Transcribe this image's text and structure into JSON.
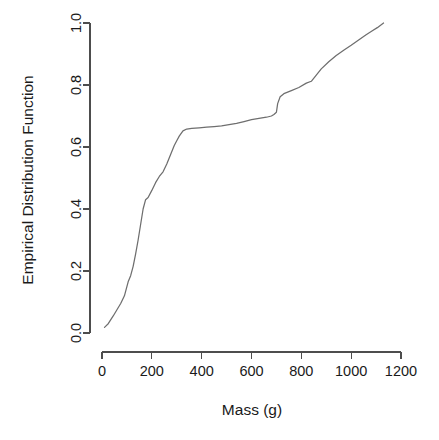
{
  "chart_data": {
    "type": "line",
    "title": "",
    "subtitle": "",
    "xlabel": "Mass (g)",
    "ylabel": "Empirical Distribution Function",
    "xlim": [
      0,
      1200
    ],
    "ylim": [
      0.0,
      1.0
    ],
    "xticks": [
      0,
      200,
      400,
      600,
      800,
      1000,
      1200
    ],
    "xtick_labels": [
      "0",
      "200",
      "400",
      "600",
      "800",
      "1000",
      "1200"
    ],
    "yticks": [
      0.0,
      0.2,
      0.4,
      0.6,
      0.8,
      1.0
    ],
    "ytick_labels": [
      "0.0",
      "0.2",
      "0.4",
      "0.6",
      "0.8",
      "1.0"
    ],
    "grid": false,
    "legend": null,
    "legend_position": "none",
    "line_color": "#6e6e6e",
    "axis_color": "#4d4d4d",
    "background_color": "#ffffff",
    "series": [
      {
        "name": "Empirical Distribution Function of Mass",
        "x": [
          10,
          25,
          45,
          60,
          75,
          90,
          105,
          115,
          125,
          135,
          145,
          155,
          165,
          175,
          185,
          200,
          215,
          230,
          245,
          260,
          275,
          290,
          300,
          310,
          325,
          340,
          360,
          390,
          420,
          450,
          480,
          510,
          540,
          570,
          600,
          630,
          660,
          680,
          690,
          700,
          705,
          715,
          730,
          760,
          790,
          820,
          840,
          860,
          880,
          910,
          940,
          970,
          1000,
          1030,
          1060,
          1085,
          1105,
          1130
        ],
        "y": [
          0.018,
          0.03,
          0.055,
          0.075,
          0.095,
          0.12,
          0.165,
          0.185,
          0.215,
          0.255,
          0.3,
          0.35,
          0.4,
          0.43,
          0.437,
          0.46,
          0.485,
          0.505,
          0.52,
          0.545,
          0.575,
          0.605,
          0.62,
          0.635,
          0.652,
          0.658,
          0.66,
          0.662,
          0.664,
          0.666,
          0.668,
          0.672,
          0.676,
          0.682,
          0.688,
          0.692,
          0.696,
          0.7,
          0.705,
          0.712,
          0.74,
          0.762,
          0.772,
          0.782,
          0.792,
          0.806,
          0.812,
          0.832,
          0.852,
          0.875,
          0.895,
          0.912,
          0.928,
          0.945,
          0.962,
          0.975,
          0.985,
          1.0
        ]
      }
    ]
  },
  "axes_geometry": {
    "x_pixel_min": 102,
    "x_pixel_max": 401,
    "y_pixel_bottom": 333,
    "y_pixel_top": 23
  }
}
